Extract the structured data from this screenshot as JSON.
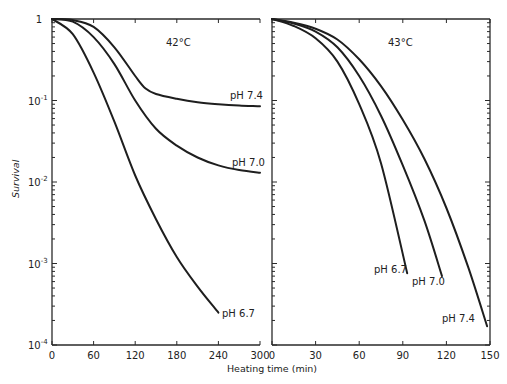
{
  "chart_data": [
    {
      "type": "line",
      "title": "42°C",
      "xlabel": "Heating time (min)",
      "ylabel": "Survival",
      "yscale": "log",
      "ylim": [
        0.0001,
        1
      ],
      "xlim": [
        0,
        300
      ],
      "xticks": [
        "0",
        "60",
        "120",
        "180",
        "240",
        "300"
      ],
      "yticks": [
        "1",
        "10^-1",
        "10^-2",
        "10^-3",
        "10^-4"
      ],
      "grid": false,
      "series": [
        {
          "name": "pH 7.4",
          "x": [
            0,
            30,
            60,
            90,
            120,
            135,
            150,
            180,
            210,
            240,
            270,
            300
          ],
          "values": [
            1.0,
            0.97,
            0.8,
            0.45,
            0.2,
            0.14,
            0.12,
            0.105,
            0.095,
            0.09,
            0.087,
            0.085
          ]
        },
        {
          "name": "pH 7.0",
          "x": [
            0,
            30,
            60,
            90,
            120,
            150,
            180,
            210,
            240,
            270,
            300
          ],
          "values": [
            1.0,
            0.93,
            0.6,
            0.28,
            0.1,
            0.045,
            0.028,
            0.02,
            0.016,
            0.014,
            0.013
          ]
        },
        {
          "name": "pH 6.7",
          "x": [
            0,
            30,
            60,
            90,
            120,
            150,
            180,
            210,
            240
          ],
          "values": [
            1.0,
            0.65,
            0.22,
            0.055,
            0.012,
            0.0035,
            0.0012,
            0.00052,
            0.00025
          ]
        }
      ]
    },
    {
      "type": "line",
      "title": "43°C",
      "xlabel": "Heating time (min)",
      "ylabel": "Survival",
      "yscale": "log",
      "ylim": [
        0.0001,
        1
      ],
      "xlim": [
        0,
        150
      ],
      "xticks": [
        "0",
        "30",
        "60",
        "90",
        "120",
        "150"
      ],
      "yticks": [
        "1",
        "10^-1",
        "10^-2",
        "10^-3",
        "10^-4"
      ],
      "grid": false,
      "series": [
        {
          "name": "pH 6.7",
          "x": [
            0,
            15,
            30,
            45,
            60,
            75,
            93
          ],
          "values": [
            1.0,
            0.82,
            0.58,
            0.3,
            0.09,
            0.017,
            0.00076
          ]
        },
        {
          "name": "pH 7.0",
          "x": [
            0,
            15,
            30,
            45,
            60,
            75,
            90,
            105,
            117
          ],
          "values": [
            1.0,
            0.88,
            0.7,
            0.45,
            0.2,
            0.065,
            0.016,
            0.0033,
            0.0007
          ]
        },
        {
          "name": "pH 7.4",
          "x": [
            0,
            15,
            30,
            45,
            60,
            75,
            90,
            105,
            120,
            135,
            148
          ],
          "values": [
            1.0,
            0.9,
            0.76,
            0.56,
            0.32,
            0.15,
            0.058,
            0.019,
            0.0048,
            0.0009,
            0.00017
          ]
        }
      ]
    }
  ],
  "labels": {
    "ylabel": "Survival",
    "xlabel": "Heating time (min)",
    "left_title": "42°C",
    "right_title": "43°C",
    "y_one": "1",
    "y_base": "10",
    "y_exp": [
      "-1",
      "-2",
      "-3",
      "-4"
    ],
    "left_xticks": [
      "0",
      "60",
      "120",
      "180",
      "240",
      "300"
    ],
    "right_xticks": [
      "0",
      "30",
      "60",
      "90",
      "120",
      "150"
    ],
    "left_series": [
      "pH 7.4",
      "pH 7.0",
      "pH 6.7"
    ],
    "right_series": [
      "pH 6.7",
      "pH 7.0",
      "pH 7.4"
    ]
  }
}
